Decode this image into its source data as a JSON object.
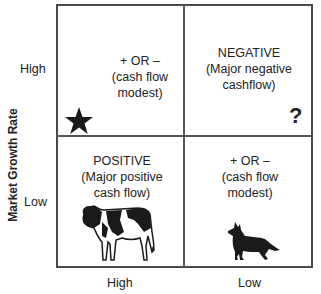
{
  "y_axis": {
    "title": "Market Growth Rate",
    "high_label": "High",
    "low_label": "Low"
  },
  "x_axis": {
    "high_label": "High",
    "low_label": "Low"
  },
  "quadrants": {
    "top_left": {
      "lines": [
        "+ OR –",
        "(cash flow",
        "modest)"
      ],
      "icon": "star-icon"
    },
    "top_right": {
      "lines": [
        "NEGATIVE",
        "(Major negative",
        "cashflow)"
      ],
      "icon": "question-mark-icon",
      "symbol": "?"
    },
    "bottom_left": {
      "lines": [
        "POSITIVE",
        "(Major positive",
        "cash flow)"
      ],
      "icon": "cow-icon"
    },
    "bottom_right": {
      "lines": [
        "+ OR –",
        "(cash flow",
        "modest)"
      ],
      "icon": "dog-icon"
    }
  },
  "colors": {
    "line": "#4a4a4a",
    "text": "#222222",
    "icon": "#1a1a1a"
  }
}
